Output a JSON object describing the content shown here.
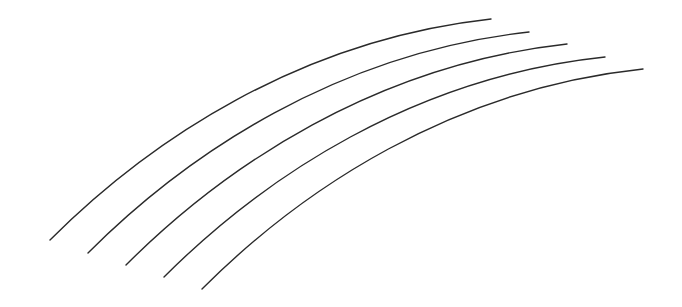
{
  "canvas": {
    "width": 682,
    "height": 307,
    "background": "#ffffff",
    "stroke_color": "#2a2a2a"
  },
  "arcs": [
    {
      "d": "M50,240 C150,140 300,40 491,19"
    },
    {
      "d": "M88,253 C188,153 338,53 529,32"
    },
    {
      "d": "M126,265 C226,165 376,65 567,44"
    },
    {
      "d": "M164,277 C264,177 414,77 605,57"
    },
    {
      "d": "M202,289 C302,189 452,89 643,69"
    }
  ]
}
